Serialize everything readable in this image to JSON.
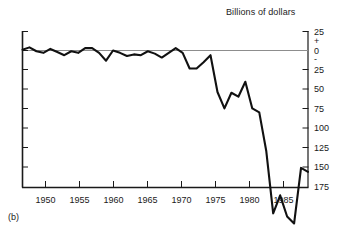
{
  "figure": {
    "caption": "(b)",
    "title": "Billions of dollars"
  },
  "chart_data": {
    "type": "line",
    "title": "Billions of dollars",
    "subtitle": "",
    "xlabel": "",
    "ylabel": "Billions of dollars",
    "caption": "(b)",
    "grid": false,
    "legend": "none",
    "zero_line": true,
    "y_sign_markers": [
      "+",
      "-"
    ],
    "xlim": [
      1947,
      1988
    ],
    "ylim": [
      -175,
      25
    ],
    "y_axis_inverted_labels": true,
    "yticks": [
      25,
      0,
      -25,
      -50,
      -75,
      -100,
      -125,
      -150,
      -175
    ],
    "ytick_labels": [
      "25",
      "0",
      "25",
      "50",
      "75",
      "100",
      "125",
      "150",
      "175"
    ],
    "xticks": [
      1950,
      1955,
      1960,
      1965,
      1970,
      1975,
      1980,
      1985
    ],
    "xtick_labels": [
      "1950",
      "1955",
      "1960",
      "1965",
      "1970",
      "1975",
      "1980",
      "1985"
    ],
    "x": [
      1947,
      1948,
      1949,
      1950,
      1951,
      1952,
      1953,
      1954,
      1955,
      1956,
      1957,
      1958,
      1959,
      1960,
      1961,
      1962,
      1963,
      1964,
      1965,
      1966,
      1967,
      1968,
      1969,
      1970,
      1971,
      1972,
      1973,
      1974,
      1975,
      1976,
      1977,
      1978,
      1979,
      1980,
      1981,
      1982,
      1983,
      1984,
      1985,
      1986,
      1987,
      1988
    ],
    "values": [
      1,
      4,
      -1,
      -3,
      2,
      -2,
      -6,
      -1,
      -3,
      3,
      3,
      -3,
      -13,
      0,
      -3,
      -7,
      -5,
      -6,
      -1,
      -4,
      -9,
      -3,
      3,
      -3,
      -23,
      -23,
      -15,
      -6,
      -53,
      -74,
      -54,
      -59,
      -40,
      -74,
      -79,
      -128,
      -208,
      -185,
      -212,
      -221,
      -150,
      -155
    ],
    "series": [
      {
        "name": "Federal budget surplus or deficit",
        "values": [
          1,
          4,
          -1,
          -3,
          2,
          -2,
          -6,
          -1,
          -3,
          3,
          3,
          -3,
          -13,
          0,
          -3,
          -7,
          -5,
          -6,
          -1,
          -4,
          -9,
          -3,
          3,
          -3,
          -23,
          -23,
          -15,
          -6,
          -53,
          -74,
          -54,
          -59,
          -40,
          -74,
          -79,
          -128,
          -208,
          -185,
          -212,
          -221,
          -150,
          -155
        ]
      }
    ],
    "notable_points": [
      {
        "x": 1974,
        "y": 17,
        "note": "peak surplus"
      },
      {
        "x": 1976,
        "y": -13,
        "note": "mid-1970s trough"
      },
      {
        "x": 1980,
        "y": 4,
        "note": "brief return toward zero"
      },
      {
        "x": 1983,
        "y": -110,
        "note": "plateau in decline"
      },
      {
        "x": 1986,
        "y": -150,
        "note": "deepest deficit"
      },
      {
        "x": 1988,
        "y": -135,
        "note": "partial rebound"
      }
    ]
  }
}
